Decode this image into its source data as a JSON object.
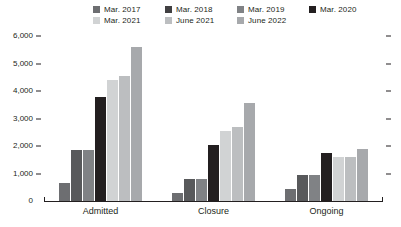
{
  "chart_data": {
    "type": "bar",
    "title": "",
    "subtitle": "",
    "xlabel": "",
    "ylabel": "",
    "ylim": [
      0,
      6000
    ],
    "ytick_labels": [
      "6,000",
      "5,000",
      "4,000",
      "3,000",
      "2,000",
      "1,000",
      "0"
    ],
    "ytick_values": [
      6000,
      5000,
      4000,
      3000,
      2000,
      1000,
      0
    ],
    "grid": false,
    "legend_position": "top",
    "categories": [
      "Admitted",
      "Closure",
      "Ongoing"
    ],
    "series": [
      {
        "name": "Mar. 2017",
        "color": "#6d6e71",
        "values": [
          650,
          300,
          450
        ]
      },
      {
        "name": "Mar. 2018",
        "color": "#58595b",
        "values": [
          1850,
          800,
          950
        ]
      },
      {
        "name": "Mar. 2019",
        "color": "#808285",
        "values": [
          1850,
          800,
          950
        ]
      },
      {
        "name": "Mar. 2020",
        "color": "#231f20",
        "values": [
          3800,
          2050,
          1750
        ]
      },
      {
        "name": "Mar. 2021",
        "color": "#d1d3d4",
        "values": [
          4400,
          2550,
          1600
        ]
      },
      {
        "name": "June 2021",
        "color": "#bcbec0",
        "values": [
          4550,
          2700,
          1600
        ]
      },
      {
        "name": "June 2022",
        "color": "#a7a9ac",
        "values": [
          5600,
          3550,
          1900
        ]
      }
    ]
  },
  "legend": {
    "items": [
      {
        "label": "Mar. 2017",
        "color": "#6d6e71"
      },
      {
        "label": "Mar. 2018",
        "color": "#414042"
      },
      {
        "label": "Mar. 2019",
        "color": "#808285"
      },
      {
        "label": "Mar. 2020",
        "color": "#231f20"
      },
      {
        "label": "Mar. 2021",
        "color": "#d1d3d4"
      },
      {
        "label": "June 2021",
        "color": "#bcbec0"
      },
      {
        "label": "June 2022",
        "color": "#a7a9ac"
      }
    ]
  },
  "axis": {
    "line_color": "#231f20"
  }
}
